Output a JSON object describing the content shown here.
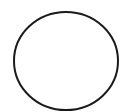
{
  "canvas": {
    "width": 123,
    "height": 112,
    "background": "#ffffff"
  },
  "shape": {
    "type": "circle-outline",
    "cx": 66,
    "cy": 61,
    "rx": 52,
    "ry": 49,
    "stroke": "#1a1a1a",
    "stroke_width": 2,
    "fill": "none"
  }
}
